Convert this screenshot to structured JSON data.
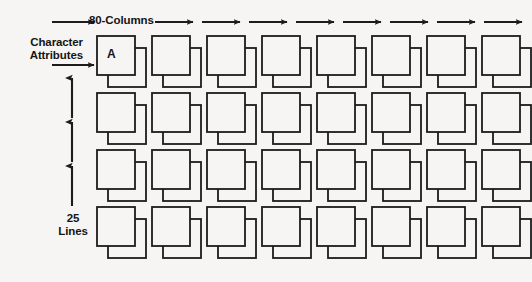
{
  "figure": {
    "background_color": "#f6f5f3",
    "line_color": "#1c1c1c"
  },
  "labels": {
    "columns": "80-Columns",
    "attributes": "Character\nAttributes",
    "attributes_line1": "Character",
    "attributes_line2": "Attributes",
    "lines_line1": "25",
    "lines_line2": "Lines",
    "sample_character": "A"
  },
  "grid": {
    "visible_columns": 8,
    "visible_rows": 4,
    "total_columns": 80,
    "total_rows": 25,
    "origin_x": 97,
    "origin_y": 36,
    "col_step": 55,
    "row_step": 57,
    "front_width": 38,
    "front_height": 39,
    "offset_x": 11,
    "offset_y": 12
  },
  "arrows": {
    "column_arrows": {
      "name": "column-flow-arrow",
      "count": 8,
      "direction": "right",
      "y": 22,
      "start_x": 155,
      "step": 47,
      "length": 38
    },
    "attribute_arrows": {
      "name": "attribute-pointer-arrow",
      "count": 2,
      "direction": "right",
      "x_start": 52,
      "x_end": 94,
      "ys": [
        22,
        65
      ]
    },
    "line_arrows": {
      "name": "line-count-arrow",
      "count": 3,
      "direction": "up",
      "x": 72,
      "segments": [
        {
          "tail_y": 118,
          "head_y": 78
        },
        {
          "tail_y": 162,
          "head_y": 122
        },
        {
          "tail_y": 206,
          "head_y": 166
        }
      ]
    }
  }
}
